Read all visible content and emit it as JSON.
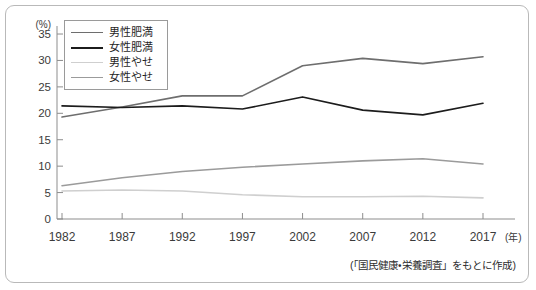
{
  "figure": {
    "source_note": "(「国民健康・栄養調査」をもとに作成)",
    "frame_color": "#b9b9b9",
    "background_color": "#ffffff"
  },
  "chart_data": {
    "type": "line",
    "title": "",
    "subtitle": "",
    "xlabel": "(年)",
    "ylabel": "(%)",
    "x": [
      1982,
      1987,
      1992,
      1997,
      2002,
      2007,
      2012,
      2017
    ],
    "xtick_labels": [
      "1982",
      "1987",
      "1992",
      "1997",
      "2002",
      "2007",
      "2012",
      "2017"
    ],
    "x_unit_label": "(年)",
    "y_unit_label": "(%)",
    "ytick_labels": [
      "0",
      "5",
      "10",
      "15",
      "20",
      "25",
      "30",
      "35"
    ],
    "yticks": [
      0,
      5,
      10,
      15,
      20,
      25,
      30,
      35
    ],
    "ylim": [
      0,
      37
    ],
    "xlim": [
      1980,
      2019
    ],
    "grid": false,
    "legend_position": "top-left",
    "series": [
      {
        "name": "男性肥満",
        "color": "#6e6e6e",
        "values": [
          19.3,
          21.2,
          23.3,
          23.3,
          29.0,
          30.4,
          29.4,
          30.7
        ]
      },
      {
        "name": "女性肥満",
        "color": "#1c1c1c",
        "values": [
          21.4,
          21.1,
          21.4,
          20.8,
          23.1,
          20.6,
          19.7,
          21.9
        ]
      },
      {
        "name": "男性やせ",
        "color": "#cfcfcf",
        "values": [
          5.3,
          5.5,
          5.3,
          4.6,
          4.2,
          4.2,
          4.3,
          4.0
        ]
      },
      {
        "name": "女性やせ",
        "color": "#9b9b9b",
        "values": [
          6.3,
          7.8,
          9.0,
          9.8,
          10.4,
          11.0,
          11.4,
          10.4
        ]
      }
    ]
  }
}
